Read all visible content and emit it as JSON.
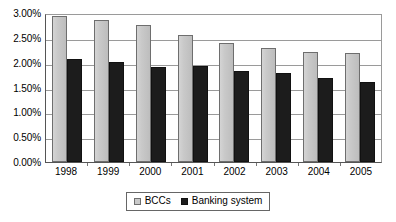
{
  "chart_data": {
    "type": "bar",
    "title": "",
    "subtitle": "",
    "xlabel": "",
    "ylabel": "",
    "categories": [
      "1998",
      "1999",
      "2000",
      "2001",
      "2002",
      "2003",
      "2004",
      "2005"
    ],
    "series": [
      {
        "name": "BCCs",
        "color": "#c9c9c9",
        "values": [
          2.94,
          2.86,
          2.76,
          2.56,
          2.4,
          2.3,
          2.22,
          2.19
        ]
      },
      {
        "name": "Banking system",
        "color": "#1c1c1c",
        "values": [
          2.08,
          2.02,
          1.91,
          1.94,
          1.83,
          1.79,
          1.69,
          1.61
        ]
      }
    ],
    "ylim": [
      0,
      3.0
    ],
    "ytick_step": 0.5,
    "ytick_labels": [
      "3.00%",
      "2.50%",
      "2.00%",
      "1.50%",
      "1.00%",
      "0.50%",
      "0.00%"
    ],
    "ytick_values": [
      3.0,
      2.5,
      2.0,
      1.5,
      1.0,
      0.5,
      0.0
    ],
    "grid": true,
    "grid_axis": "y",
    "legend_position": "bottom",
    "value_format": "percent"
  }
}
